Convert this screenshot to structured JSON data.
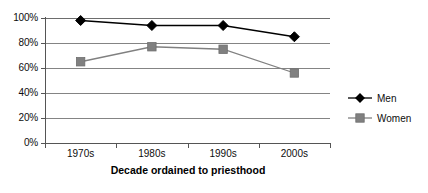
{
  "chart_data": {
    "type": "line",
    "title": "",
    "subtitle": "",
    "xlabel": "Decade ordained to priesthood",
    "ylabel": "",
    "categories": [
      "1970s",
      "1980s",
      "1990s",
      "2000s"
    ],
    "series": [
      {
        "name": "Men",
        "values": [
          98,
          94,
          94,
          85
        ],
        "color": "#000000",
        "marker": "diamond"
      },
      {
        "name": "Women",
        "values": [
          65,
          77,
          75,
          56
        ],
        "color": "#808080",
        "marker": "square"
      }
    ],
    "ylim": [
      0,
      100
    ],
    "ytick_labels": [
      "100%",
      "80%",
      "60%",
      "40%",
      "20%",
      "0%"
    ],
    "ytick_values": [
      100,
      80,
      60,
      40,
      20,
      0
    ],
    "grid": true,
    "grid_axis": "y",
    "legend_position": "right"
  },
  "axis": {
    "y_ticks": [
      {
        "label": "100%"
      },
      {
        "label": "80%"
      },
      {
        "label": "60%"
      },
      {
        "label": "40%"
      },
      {
        "label": "20%"
      },
      {
        "label": "0%"
      }
    ],
    "x_ticks": [
      {
        "label": "1970s"
      },
      {
        "label": "1980s"
      },
      {
        "label": "1990s"
      },
      {
        "label": "2000s"
      }
    ],
    "x_title": "Decade ordained to priesthood"
  },
  "legend": {
    "entries": [
      {
        "label": "Men",
        "color": "#000000"
      },
      {
        "label": "Women",
        "color": "#808080"
      }
    ]
  },
  "colors": {
    "men": "#000000",
    "women": "#808080",
    "gridline": "#848484",
    "axis": "#555555",
    "background": "#ffffff",
    "text": "#0d0d0d"
  }
}
